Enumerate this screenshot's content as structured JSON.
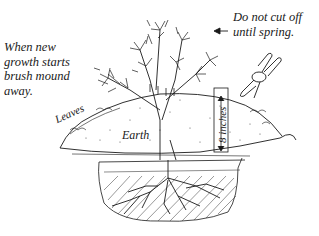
{
  "figure": {
    "notes": {
      "left": "When new\ngrowth starts\nbrush mound\naway.",
      "right": "Do not cut off\nuntil spring."
    },
    "labels": {
      "leaves": "Leaves",
      "earth": "Earth",
      "depth": "8 inches"
    },
    "icons": {
      "shrub": "shrub-illustration",
      "pruners": "pruning-shears-icon",
      "arrow": "arrow-left-icon",
      "roots": "root-system"
    },
    "colors": {
      "ink": "#1a1a1a",
      "background": "#ffffff",
      "stipple": "#555555"
    }
  }
}
